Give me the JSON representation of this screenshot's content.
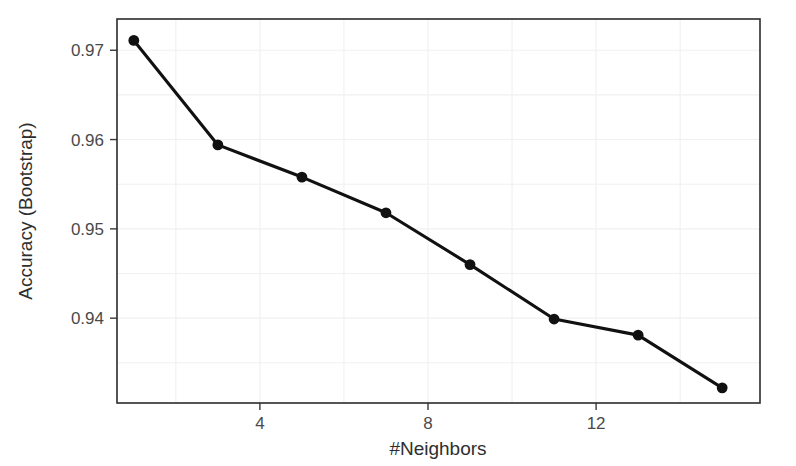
{
  "chart_data": {
    "type": "line",
    "title": "",
    "xlabel": "#Neighbors",
    "ylabel": "Accuracy (Bootstrap)",
    "x": [
      1,
      3,
      5,
      7,
      9,
      11,
      13,
      15
    ],
    "values": [
      0.9711,
      0.9594,
      0.9558,
      0.9518,
      0.946,
      0.9399,
      0.9381,
      0.9322
    ],
    "series": [
      {
        "name": "Accuracy (Bootstrap)",
        "values": [
          0.9711,
          0.9594,
          0.9558,
          0.9518,
          0.946,
          0.9399,
          0.9381,
          0.9322
        ]
      }
    ],
    "points": [
      {
        "x": 1,
        "y": 0.9711
      },
      {
        "x": 3,
        "y": 0.9594
      },
      {
        "x": 5,
        "y": 0.9558
      },
      {
        "x": 7,
        "y": 0.9518
      },
      {
        "x": 9,
        "y": 0.946
      },
      {
        "x": 11,
        "y": 0.9399
      },
      {
        "x": 13,
        "y": 0.9381
      },
      {
        "x": 15,
        "y": 0.9322
      }
    ],
    "xlim": [
      0.6,
      15.9
    ],
    "ylim": [
      0.9305,
      0.9735
    ],
    "x_ticks": [
      4,
      8,
      12
    ],
    "x_tick_labels": [
      "4",
      "8",
      "12"
    ],
    "y_ticks": [
      0.94,
      0.95,
      0.96,
      0.97
    ],
    "y_tick_labels": [
      "0.94",
      "0.95",
      "0.96",
      "0.97"
    ],
    "grid": true,
    "grid_minor": true,
    "legend": "none",
    "line_color": "#111111",
    "point_color": "#111111",
    "grid_color": "#f0f0f0",
    "panel_border_color": "#2b2b2b",
    "background_color": "#ffffff"
  },
  "axis": {
    "x_title": "#Neighbors",
    "y_title": "Accuracy (Bootstrap)"
  }
}
